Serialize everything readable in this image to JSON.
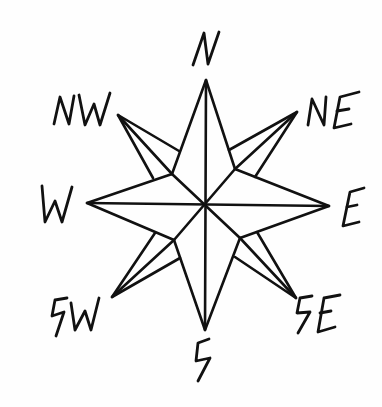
{
  "diagram": {
    "type": "compass-rose",
    "style": "hand-drawn black ink on white",
    "center": [
      206,
      204
    ],
    "colors": {
      "ink": "#111111",
      "background": "#fefefe"
    },
    "labels": {
      "N": "N",
      "NE": "NE",
      "E": "E",
      "SE": "SE",
      "S": "S",
      "SW": "SW",
      "W": "W",
      "NW": "NW"
    },
    "points": [
      {
        "id": "N",
        "label": "N",
        "tip": [
          206,
          80
        ]
      },
      {
        "id": "NE",
        "label": "NE",
        "tip": [
          297,
          112
        ]
      },
      {
        "id": "E",
        "label": "E",
        "tip": [
          329,
          206
        ]
      },
      {
        "id": "SE",
        "label": "SE",
        "tip": [
          296,
          298
        ]
      },
      {
        "id": "S",
        "label": "S",
        "tip": [
          205,
          330
        ]
      },
      {
        "id": "SW",
        "label": "SW",
        "tip": [
          112,
          297
        ]
      },
      {
        "id": "W",
        "label": "W",
        "tip": [
          87,
          203
        ]
      },
      {
        "id": "NW",
        "label": "NW",
        "tip": [
          118,
          115
        ]
      }
    ]
  }
}
